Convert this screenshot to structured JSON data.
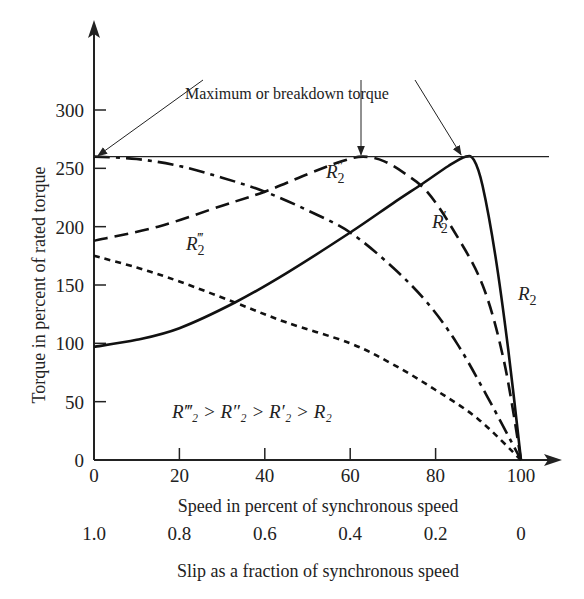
{
  "chart_data": {
    "type": "line",
    "title": "",
    "xlabel": "Speed in percent of synchronous speed",
    "ylabel": "Torque in percent of rated torque",
    "x2label": "Slip as a fraction of synchronous speed",
    "xlim": [
      0,
      100
    ],
    "ylim": [
      0,
      300
    ],
    "xticks": [
      0,
      20,
      40,
      60,
      80,
      100
    ],
    "xtick_labels": [
      "0",
      "20",
      "40",
      "60",
      "80",
      "100"
    ],
    "x2tick_labels": [
      "1.0",
      "0.8",
      "0.6",
      "0.4",
      "0.2",
      "0"
    ],
    "yticks": [
      0,
      50,
      100,
      150,
      200,
      250,
      300
    ],
    "ytick_labels": [
      "0",
      "50",
      "100",
      "150",
      "200",
      "250",
      "300"
    ],
    "grid": false,
    "reference_line": {
      "y": 260,
      "label": "Maximum or breakdown torque"
    },
    "annotation": "R‴₂ > R″₂ > R′₂ > R₂",
    "series": [
      {
        "name": "R2",
        "label_main": "R",
        "label_sub": "2",
        "label_prime": "",
        "style": "solid",
        "x": [
          0,
          10,
          20,
          33,
          45,
          60,
          70,
          77,
          83,
          87,
          89,
          91,
          94,
          97,
          100
        ],
        "y": [
          97,
          103,
          113,
          135,
          160,
          195,
          220,
          237,
          252,
          260,
          257,
          235,
          175,
          95,
          0
        ]
      },
      {
        "name": "R2'",
        "label_main": "R",
        "label_sub": "2",
        "label_prime": "′",
        "style": "dashed",
        "x": [
          0,
          15,
          30,
          40,
          50,
          58,
          63,
          68,
          73,
          78,
          84,
          91,
          96,
          100
        ],
        "y": [
          188,
          200,
          218,
          230,
          245,
          256,
          260,
          256,
          245,
          230,
          198,
          150,
          85,
          0
        ]
      },
      {
        "name": "R2''",
        "label_main": "R",
        "label_sub": "2",
        "label_prime": "″",
        "style": "dashdot",
        "x": [
          0,
          10,
          20,
          30,
          40,
          50,
          60,
          70,
          78,
          85,
          92,
          100
        ],
        "y": [
          260,
          258,
          252,
          242,
          230,
          214,
          195,
          165,
          135,
          100,
          55,
          0
        ]
      },
      {
        "name": "R2'''",
        "label_main": "R",
        "label_sub": "2",
        "label_prime": "‴",
        "style": "dotted",
        "x": [
          0,
          10,
          20,
          33,
          45,
          60,
          70,
          80,
          90,
          100
        ],
        "y": [
          175,
          165,
          153,
          135,
          118,
          100,
          82,
          60,
          35,
          0
        ]
      }
    ],
    "legend": "inline labels on curves"
  }
}
